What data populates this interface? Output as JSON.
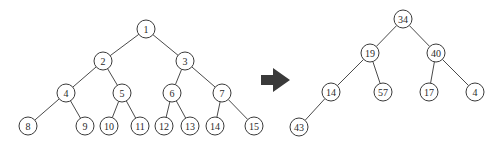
{
  "left_tree": {
    "radius": 9,
    "nodes": [
      {
        "id": "1",
        "label": "1",
        "x": 146,
        "y": 29
      },
      {
        "id": "2",
        "label": "2",
        "x": 103,
        "y": 61
      },
      {
        "id": "3",
        "label": "3",
        "x": 185,
        "y": 61
      },
      {
        "id": "4",
        "label": "4",
        "x": 66,
        "y": 93
      },
      {
        "id": "5",
        "label": "5",
        "x": 122,
        "y": 93
      },
      {
        "id": "6",
        "label": "6",
        "x": 172,
        "y": 93
      },
      {
        "id": "7",
        "label": "7",
        "x": 222,
        "y": 93
      },
      {
        "id": "8",
        "label": "8",
        "x": 28,
        "y": 126
      },
      {
        "id": "9",
        "label": "9",
        "x": 85,
        "y": 126
      },
      {
        "id": "10",
        "label": "10",
        "x": 109,
        "y": 126
      },
      {
        "id": "11",
        "label": "11",
        "x": 140,
        "y": 126
      },
      {
        "id": "12",
        "label": "12",
        "x": 164,
        "y": 126
      },
      {
        "id": "13",
        "label": "13",
        "x": 190,
        "y": 126
      },
      {
        "id": "14",
        "label": "14",
        "x": 215,
        "y": 126
      },
      {
        "id": "15",
        "label": "15",
        "x": 254,
        "y": 126
      }
    ],
    "edges": [
      [
        "1",
        "2"
      ],
      [
        "1",
        "3"
      ],
      [
        "2",
        "4"
      ],
      [
        "2",
        "5"
      ],
      [
        "3",
        "6"
      ],
      [
        "3",
        "7"
      ],
      [
        "4",
        "8"
      ],
      [
        "4",
        "9"
      ],
      [
        "5",
        "10"
      ],
      [
        "5",
        "11"
      ],
      [
        "6",
        "12"
      ],
      [
        "6",
        "13"
      ],
      [
        "7",
        "14"
      ],
      [
        "7",
        "15"
      ]
    ]
  },
  "arrow": {
    "color": "#3a3a3a",
    "direction": "right"
  },
  "right_tree": {
    "radius": 9,
    "nodes": [
      {
        "id": "r34",
        "label": "34",
        "x": 403,
        "y": 19
      },
      {
        "id": "r19",
        "label": "19",
        "x": 370,
        "y": 53
      },
      {
        "id": "r40",
        "label": "40",
        "x": 436,
        "y": 53
      },
      {
        "id": "r14",
        "label": "14",
        "x": 331,
        "y": 92
      },
      {
        "id": "r57",
        "label": "57",
        "x": 383,
        "y": 92
      },
      {
        "id": "r17",
        "label": "17",
        "x": 429,
        "y": 92
      },
      {
        "id": "r4",
        "label": "4",
        "x": 475,
        "y": 92
      },
      {
        "id": "r43",
        "label": "43",
        "x": 299,
        "y": 127
      }
    ],
    "edges": [
      [
        "r34",
        "r19"
      ],
      [
        "r34",
        "r40"
      ],
      [
        "r19",
        "r14"
      ],
      [
        "r19",
        "r57"
      ],
      [
        "r40",
        "r17"
      ],
      [
        "r40",
        "r4"
      ],
      [
        "r14",
        "r43"
      ]
    ]
  }
}
